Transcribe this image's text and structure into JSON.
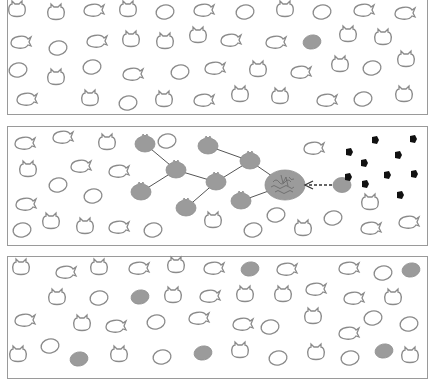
{
  "figure": {
    "colors": {
      "outline_cell": "#8a8a8a",
      "filled_cell": "#9b9b9b",
      "particle": "#111111",
      "link": "#555555"
    },
    "legend_shapes": [
      "oval",
      "eared",
      "tailed"
    ],
    "panels": [
      {
        "id": "panel-1",
        "cells": [
          {
            "x": 17,
            "y": 12,
            "t": "eared"
          },
          {
            "x": 56,
            "y": 15,
            "t": "eared"
          },
          {
            "x": 93,
            "y": 10,
            "t": "tailed"
          },
          {
            "x": 128,
            "y": 12,
            "t": "eared"
          },
          {
            "x": 165,
            "y": 12,
            "t": "oval"
          },
          {
            "x": 203,
            "y": 10,
            "t": "tailed"
          },
          {
            "x": 245,
            "y": 12,
            "t": "oval"
          },
          {
            "x": 285,
            "y": 12,
            "t": "eared"
          },
          {
            "x": 322,
            "y": 12,
            "t": "oval"
          },
          {
            "x": 363,
            "y": 10,
            "t": "tailed"
          },
          {
            "x": 404,
            "y": 13,
            "t": "tailed"
          },
          {
            "x": 20,
            "y": 42,
            "t": "tailed"
          },
          {
            "x": 58,
            "y": 48,
            "t": "oval"
          },
          {
            "x": 96,
            "y": 41,
            "t": "tailed"
          },
          {
            "x": 131,
            "y": 42,
            "t": "eared"
          },
          {
            "x": 165,
            "y": 44,
            "t": "eared"
          },
          {
            "x": 198,
            "y": 38,
            "t": "eared"
          },
          {
            "x": 230,
            "y": 40,
            "t": "tailed"
          },
          {
            "x": 275,
            "y": 42,
            "t": "tailed",
            "filled": false
          },
          {
            "x": 312,
            "y": 42,
            "t": "oval",
            "filled": true
          },
          {
            "x": 348,
            "y": 37,
            "t": "eared"
          },
          {
            "x": 383,
            "y": 40,
            "t": "eared"
          },
          {
            "x": 18,
            "y": 70,
            "t": "oval"
          },
          {
            "x": 56,
            "y": 80,
            "t": "eared"
          },
          {
            "x": 92,
            "y": 67,
            "t": "oval"
          },
          {
            "x": 132,
            "y": 74,
            "t": "tailed"
          },
          {
            "x": 180,
            "y": 72,
            "t": "oval"
          },
          {
            "x": 214,
            "y": 68,
            "t": "tailed"
          },
          {
            "x": 258,
            "y": 72,
            "t": "eared"
          },
          {
            "x": 300,
            "y": 72,
            "t": "tailed"
          },
          {
            "x": 340,
            "y": 67,
            "t": "eared"
          },
          {
            "x": 372,
            "y": 68,
            "t": "oval"
          },
          {
            "x": 406,
            "y": 62,
            "t": "eared"
          },
          {
            "x": 26,
            "y": 99,
            "t": "tailed"
          },
          {
            "x": 90,
            "y": 101,
            "t": "eared"
          },
          {
            "x": 128,
            "y": 103,
            "t": "oval"
          },
          {
            "x": 164,
            "y": 102,
            "t": "eared"
          },
          {
            "x": 203,
            "y": 100,
            "t": "tailed"
          },
          {
            "x": 240,
            "y": 97,
            "t": "eared"
          },
          {
            "x": 280,
            "y": 99,
            "t": "eared"
          },
          {
            "x": 326,
            "y": 100,
            "t": "tailed"
          },
          {
            "x": 363,
            "y": 99,
            "t": "oval"
          },
          {
            "x": 404,
            "y": 97,
            "t": "eared"
          }
        ]
      },
      {
        "id": "panel-2",
        "cells": [
          {
            "x": 24,
            "y": 143,
            "t": "tailed"
          },
          {
            "x": 62,
            "y": 137,
            "t": "tailed"
          },
          {
            "x": 107,
            "y": 145,
            "t": "eared"
          },
          {
            "x": 167,
            "y": 141,
            "t": "oval"
          },
          {
            "x": 313,
            "y": 148,
            "t": "tailed"
          },
          {
            "x": 28,
            "y": 172,
            "t": "eared"
          },
          {
            "x": 80,
            "y": 166,
            "t": "tailed"
          },
          {
            "x": 118,
            "y": 171,
            "t": "tailed"
          },
          {
            "x": 58,
            "y": 185,
            "t": "oval"
          },
          {
            "x": 93,
            "y": 196,
            "t": "oval"
          },
          {
            "x": 25,
            "y": 204,
            "t": "tailed"
          },
          {
            "x": 22,
            "y": 230,
            "t": "oval"
          },
          {
            "x": 51,
            "y": 224,
            "t": "eared"
          },
          {
            "x": 85,
            "y": 229,
            "t": "eared"
          },
          {
            "x": 118,
            "y": 227,
            "t": "tailed"
          },
          {
            "x": 153,
            "y": 230,
            "t": "oval"
          },
          {
            "x": 213,
            "y": 223,
            "t": "eared"
          },
          {
            "x": 276,
            "y": 215,
            "t": "oval"
          },
          {
            "x": 253,
            "y": 230,
            "t": "oval"
          },
          {
            "x": 303,
            "y": 231,
            "t": "eared"
          },
          {
            "x": 333,
            "y": 218,
            "t": "oval"
          },
          {
            "x": 370,
            "y": 228,
            "t": "tailed"
          },
          {
            "x": 408,
            "y": 222,
            "t": "tailed"
          },
          {
            "x": 370,
            "y": 205,
            "t": "eared"
          }
        ],
        "network": {
          "nodes": [
            {
              "id": "n1",
              "x": 145,
              "y": 144
            },
            {
              "id": "n2",
              "x": 176,
              "y": 170
            },
            {
              "id": "n3",
              "x": 141,
              "y": 192
            },
            {
              "id": "n4",
              "x": 208,
              "y": 146
            },
            {
              "id": "n5",
              "x": 216,
              "y": 182
            },
            {
              "id": "n6",
              "x": 186,
              "y": 208
            },
            {
              "id": "n7",
              "x": 250,
              "y": 161
            },
            {
              "id": "n8",
              "x": 241,
              "y": 201
            }
          ],
          "hub": {
            "x": 285,
            "y": 185,
            "rx": 20,
            "ry": 15,
            "label": "annotated hub cell"
          },
          "edges": [
            [
              "n1",
              "n2"
            ],
            [
              "n2",
              "n3"
            ],
            [
              "n2",
              "n5"
            ],
            [
              "n4",
              "n7"
            ],
            [
              "n5",
              "n7"
            ],
            [
              "n5",
              "n6"
            ],
            [
              "n7",
              "hub"
            ],
            [
              "n8",
              "hub"
            ]
          ]
        },
        "arrow": {
          "from": {
            "x": 332,
            "y": 185
          },
          "to": {
            "x": 305,
            "y": 185
          },
          "style": "dashed"
        },
        "source_cell": {
          "x": 342,
          "y": 185
        },
        "particles": [
          {
            "x": 375,
            "y": 140
          },
          {
            "x": 413,
            "y": 139
          },
          {
            "x": 349,
            "y": 152
          },
          {
            "x": 398,
            "y": 155
          },
          {
            "x": 364,
            "y": 163
          },
          {
            "x": 387,
            "y": 175
          },
          {
            "x": 414,
            "y": 174
          },
          {
            "x": 348,
            "y": 177
          },
          {
            "x": 365,
            "y": 184
          },
          {
            "x": 400,
            "y": 195
          }
        ]
      },
      {
        "id": "panel-3",
        "cells": [
          {
            "x": 21,
            "y": 270,
            "t": "eared"
          },
          {
            "x": 65,
            "y": 272,
            "t": "tailed"
          },
          {
            "x": 99,
            "y": 270,
            "t": "eared"
          },
          {
            "x": 138,
            "y": 268,
            "t": "tailed"
          },
          {
            "x": 176,
            "y": 268,
            "t": "eared"
          },
          {
            "x": 213,
            "y": 268,
            "t": "tailed"
          },
          {
            "x": 250,
            "y": 269,
            "t": "oval",
            "filled": true
          },
          {
            "x": 286,
            "y": 269,
            "t": "tailed"
          },
          {
            "x": 348,
            "y": 268,
            "t": "tailed"
          },
          {
            "x": 383,
            "y": 273,
            "t": "oval"
          },
          {
            "x": 411,
            "y": 270,
            "t": "oval",
            "filled": true
          },
          {
            "x": 57,
            "y": 300,
            "t": "eared"
          },
          {
            "x": 99,
            "y": 298,
            "t": "oval"
          },
          {
            "x": 140,
            "y": 297,
            "t": "oval",
            "filled": true
          },
          {
            "x": 173,
            "y": 298,
            "t": "eared"
          },
          {
            "x": 209,
            "y": 296,
            "t": "tailed"
          },
          {
            "x": 245,
            "y": 297,
            "t": "eared"
          },
          {
            "x": 283,
            "y": 297,
            "t": "eared"
          },
          {
            "x": 315,
            "y": 289,
            "t": "tailed"
          },
          {
            "x": 353,
            "y": 298,
            "t": "tailed"
          },
          {
            "x": 393,
            "y": 300,
            "t": "eared"
          },
          {
            "x": 24,
            "y": 320,
            "t": "tailed"
          },
          {
            "x": 82,
            "y": 326,
            "t": "eared"
          },
          {
            "x": 115,
            "y": 326,
            "t": "tailed"
          },
          {
            "x": 156,
            "y": 322,
            "t": "oval"
          },
          {
            "x": 198,
            "y": 318,
            "t": "tailed"
          },
          {
            "x": 242,
            "y": 324,
            "t": "tailed"
          },
          {
            "x": 270,
            "y": 327,
            "t": "oval"
          },
          {
            "x": 313,
            "y": 319,
            "t": "eared"
          },
          {
            "x": 348,
            "y": 333,
            "t": "tailed"
          },
          {
            "x": 373,
            "y": 318,
            "t": "oval"
          },
          {
            "x": 409,
            "y": 324,
            "t": "oval"
          },
          {
            "x": 18,
            "y": 357,
            "t": "eared"
          },
          {
            "x": 50,
            "y": 346,
            "t": "oval"
          },
          {
            "x": 79,
            "y": 359,
            "t": "oval",
            "filled": true
          },
          {
            "x": 119,
            "y": 357,
            "t": "eared"
          },
          {
            "x": 162,
            "y": 357,
            "t": "oval"
          },
          {
            "x": 203,
            "y": 353,
            "t": "oval",
            "filled": true
          },
          {
            "x": 240,
            "y": 353,
            "t": "eared"
          },
          {
            "x": 278,
            "y": 358,
            "t": "oval"
          },
          {
            "x": 316,
            "y": 355,
            "t": "eared"
          },
          {
            "x": 350,
            "y": 358,
            "t": "oval"
          },
          {
            "x": 384,
            "y": 351,
            "t": "oval",
            "filled": true
          },
          {
            "x": 410,
            "y": 358,
            "t": "eared"
          }
        ]
      }
    ]
  }
}
